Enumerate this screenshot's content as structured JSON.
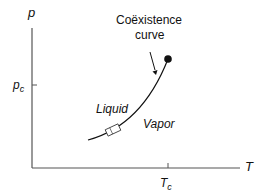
{
  "diagram": {
    "axes": {
      "y_label": "p",
      "x_label": "T",
      "y_tick": {
        "base": "p",
        "sub": "c"
      },
      "x_tick": {
        "base": "T",
        "sub": "c"
      }
    },
    "annotation": {
      "line1": "Coëxistence",
      "line2": "curve"
    },
    "regions": {
      "liquid": "Liquid",
      "vapor": "Vapor"
    },
    "colors": {
      "axis": "#555555",
      "curve": "#111111",
      "critical_point": "#111111"
    }
  }
}
